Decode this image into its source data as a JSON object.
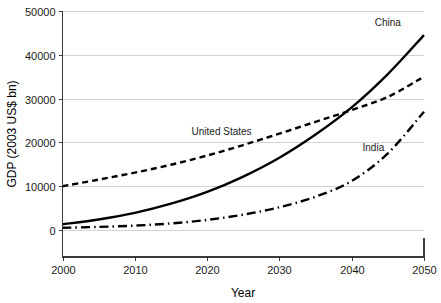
{
  "chart_data": {
    "type": "line",
    "title": "",
    "xlabel": "Year",
    "ylabel": "GDP (2003 US$ bn)",
    "xlim": [
      2000,
      2050
    ],
    "ylim": [
      0,
      50000
    ],
    "xticks": [
      "2000",
      "2010",
      "2020",
      "2030",
      "2040",
      "2050"
    ],
    "yticks": [
      "0",
      "10000",
      "20000",
      "30000",
      "40000",
      "50000"
    ],
    "grid": "horizontal",
    "legend_position": "inline-annotations",
    "x": [
      2000,
      2005,
      2010,
      2015,
      2020,
      2025,
      2030,
      2035,
      2040,
      2045,
      2050
    ],
    "series": [
      {
        "name": "China",
        "style": "solid",
        "color": "#000000",
        "values": [
          1300,
          2400,
          3900,
          6000,
          8700,
          12200,
          16500,
          21800,
          28000,
          35600,
          44500
        ]
      },
      {
        "name": "United States",
        "style": "dashed",
        "color": "#000000",
        "values": [
          10000,
          11500,
          13100,
          14900,
          17000,
          19400,
          22000,
          24700,
          27400,
          30400,
          35000
        ]
      },
      {
        "name": "India",
        "style": "dash-dot",
        "color": "#000000",
        "values": [
          500,
          700,
          1000,
          1500,
          2300,
          3500,
          5200,
          7600,
          11200,
          17500,
          27000
        ]
      }
    ],
    "annotations": [
      {
        "text": "China",
        "x": 2045,
        "y": 46500
      },
      {
        "text": "United States",
        "x": 2022,
        "y": 21600
      },
      {
        "text": "India",
        "x": 2043,
        "y": 18000
      }
    ]
  },
  "axes": {
    "x_title": "Year",
    "y_title": "GDP (2003 US$ bn)"
  }
}
